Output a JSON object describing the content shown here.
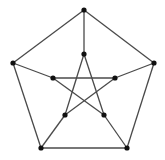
{
  "diagram": {
    "type": "graph",
    "name": "Petersen graph",
    "colors": {
      "edge": "#4a4a4a",
      "node": "#111111",
      "background": "#ffffff"
    },
    "node_radius": 2.6,
    "nodes": [
      {
        "id": "o0",
        "x": 84,
        "y": 10
      },
      {
        "id": "o1",
        "x": 154,
        "y": 63
      },
      {
        "id": "o2",
        "x": 127,
        "y": 148
      },
      {
        "id": "o3",
        "x": 41,
        "y": 148
      },
      {
        "id": "o4",
        "x": 13,
        "y": 63
      },
      {
        "id": "i0",
        "x": 84,
        "y": 54
      },
      {
        "id": "i1",
        "x": 115,
        "y": 78
      },
      {
        "id": "i2",
        "x": 104,
        "y": 115
      },
      {
        "id": "i3",
        "x": 65,
        "y": 115
      },
      {
        "id": "i4",
        "x": 53,
        "y": 78
      }
    ],
    "edges": [
      [
        "o0",
        "o1"
      ],
      [
        "o1",
        "o2"
      ],
      [
        "o2",
        "o3"
      ],
      [
        "o3",
        "o4"
      ],
      [
        "o4",
        "o0"
      ],
      [
        "o0",
        "i0"
      ],
      [
        "o1",
        "i1"
      ],
      [
        "o2",
        "i2"
      ],
      [
        "o3",
        "i3"
      ],
      [
        "o4",
        "i4"
      ],
      [
        "i0",
        "i2"
      ],
      [
        "i2",
        "i4"
      ],
      [
        "i4",
        "i1"
      ],
      [
        "i1",
        "i3"
      ],
      [
        "i3",
        "i0"
      ]
    ]
  }
}
